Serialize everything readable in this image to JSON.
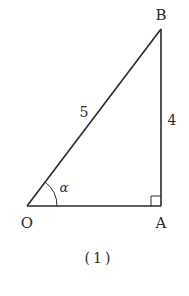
{
  "diagram": {
    "type": "right-triangle",
    "vertices": {
      "O": {
        "label": "O",
        "x": 27,
        "y": 206
      },
      "A": {
        "label": "A",
        "x": 161,
        "y": 206
      },
      "B": {
        "label": "B",
        "x": 161,
        "y": 29
      }
    },
    "edge_labels": {
      "OB": "5",
      "AB": "4"
    },
    "angle_label": "α",
    "right_angle_at": "A",
    "caption": "(1)",
    "colors": {
      "stroke": "#2a2a2a",
      "background": "#ffffff"
    }
  }
}
